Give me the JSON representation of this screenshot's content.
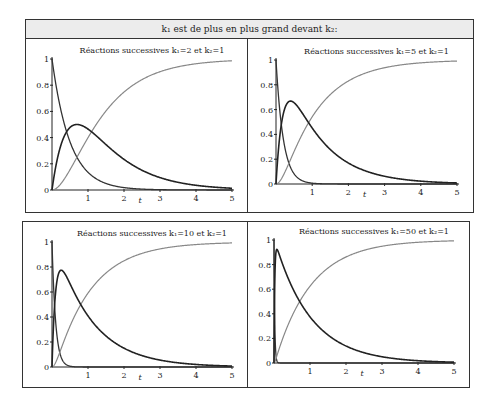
{
  "header": {
    "title": "k₁ est de plus en plus grand devant  k₂:"
  },
  "chart_data": [
    {
      "type": "line",
      "title": "Réactions successives k₁=2 et  k₂=1",
      "k1": 2,
      "k2": 1,
      "xlabel": "t",
      "xlim": [
        0,
        5
      ],
      "ylim": [
        0,
        1
      ],
      "xticks": [
        "1",
        "2",
        "3",
        "4",
        "5"
      ],
      "yticks": [
        "0",
        "0.2",
        "0.4",
        "0.6",
        "0.8",
        "1"
      ],
      "series": [
        {
          "name": "A",
          "color": "#333333"
        },
        {
          "name": "B",
          "color": "#222222",
          "peak": 0.5
        },
        {
          "name": "C",
          "color": "#888888"
        }
      ],
      "box": {
        "x0": 52,
        "y0": 190,
        "x5": 232,
        "y1": 59
      }
    },
    {
      "type": "line",
      "title": "Réactions successives k₁=5 et  k₂=1",
      "k1": 5,
      "k2": 1,
      "xlabel": "t",
      "xlim": [
        0,
        5
      ],
      "ylim": [
        0,
        1
      ],
      "xticks": [
        "1",
        "2",
        "3",
        "4",
        "5"
      ],
      "yticks": [
        "0",
        "0.2",
        "0.4",
        "0.6",
        "0.8",
        "1"
      ],
      "series": [
        {
          "name": "A",
          "color": "#333333"
        },
        {
          "name": "B",
          "color": "#222222",
          "peak": 0.67
        },
        {
          "name": "C",
          "color": "#888888"
        }
      ],
      "box": {
        "x0": 276,
        "y0": 184,
        "x5": 457,
        "y1": 60
      }
    },
    {
      "type": "line",
      "title": "Réactions successives k₁=10 et  k₂=1",
      "k1": 10,
      "k2": 1,
      "xlabel": "t",
      "xlim": [
        0,
        5
      ],
      "ylim": [
        0,
        1
      ],
      "xticks": [
        "1",
        "2",
        "3",
        "4",
        "5"
      ],
      "yticks": [
        "0",
        "0.2",
        "0.4",
        "0.6",
        "0.8",
        "1"
      ],
      "series": [
        {
          "name": "A",
          "color": "#333333"
        },
        {
          "name": "B",
          "color": "#222222",
          "peak": 0.77
        },
        {
          "name": "C",
          "color": "#888888"
        }
      ],
      "box": {
        "x0": 52,
        "y0": 367,
        "x5": 232,
        "y1": 242
      }
    },
    {
      "type": "line",
      "title": "Réactions successives k₁=50 et  k₂=1",
      "k1": 50,
      "k2": 1,
      "xlabel": "t",
      "xlim": [
        0,
        5
      ],
      "ylim": [
        0,
        1
      ],
      "xticks": [
        "1",
        "2",
        "3",
        "4",
        "5"
      ],
      "yticks": [
        "0",
        "0.2",
        "0.4",
        "0.6",
        "0.8",
        "1"
      ],
      "series": [
        {
          "name": "A",
          "color": "#333333"
        },
        {
          "name": "B",
          "color": "#222222",
          "peak": 0.92
        },
        {
          "name": "C",
          "color": "#888888"
        }
      ],
      "box": {
        "x0": 274,
        "y0": 363,
        "x5": 454,
        "y1": 240
      }
    }
  ]
}
